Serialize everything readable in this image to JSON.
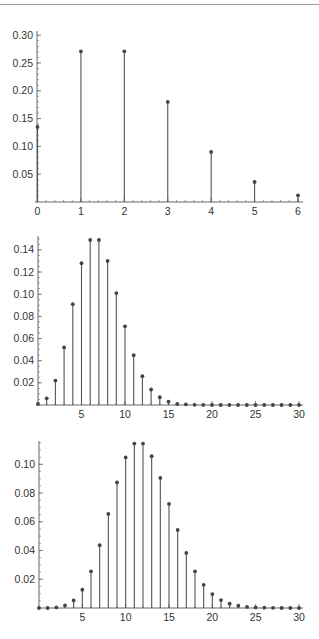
{
  "chart_data": [
    {
      "type": "stem",
      "title": "",
      "xlabel": "",
      "ylabel": "",
      "description": "Poisson probability mass function, lambda = 2",
      "x": [
        0,
        1,
        2,
        3,
        4,
        5,
        6
      ],
      "values": [
        0.135,
        0.271,
        0.271,
        0.18,
        0.09,
        0.036,
        0.012
      ],
      "xlim": [
        0,
        6
      ],
      "ylim": [
        0,
        0.31
      ],
      "xticks": [
        "0",
        "1",
        "2",
        "3",
        "4",
        "5",
        "6"
      ],
      "yticks": [
        "0.05",
        "0.10",
        "0.15",
        "0.20",
        "0.25",
        "0.30"
      ],
      "grid": false,
      "legend": null
    },
    {
      "type": "stem",
      "title": "",
      "xlabel": "",
      "ylabel": "",
      "description": "Poisson probability mass function, lambda = 7",
      "x": [
        0,
        1,
        2,
        3,
        4,
        5,
        6,
        7,
        8,
        9,
        10,
        11,
        12,
        13,
        14,
        15,
        16,
        17,
        18,
        19,
        20,
        21,
        22,
        23,
        24,
        25,
        26,
        27,
        28,
        29,
        30
      ],
      "values": [
        0.001,
        0.006,
        0.022,
        0.052,
        0.091,
        0.128,
        0.149,
        0.149,
        0.13,
        0.101,
        0.071,
        0.045,
        0.026,
        0.014,
        0.007,
        0.003,
        0.001,
        0.0006,
        0.0002,
        0.0001,
        0,
        0,
        0,
        0,
        0,
        0,
        0,
        0,
        0,
        0,
        0
      ],
      "xlim": [
        0,
        30
      ],
      "ylim": [
        0,
        0.152
      ],
      "xticks": [
        "5",
        "10",
        "15",
        "20",
        "25",
        "30"
      ],
      "yticks": [
        "0.02",
        "0.04",
        "0.06",
        "0.08",
        "0.10",
        "0.12",
        "0.14"
      ],
      "grid": false,
      "legend": null
    },
    {
      "type": "stem",
      "title": "",
      "xlabel": "",
      "ylabel": "",
      "description": "Poisson probability mass function, lambda = 12",
      "x": [
        0,
        1,
        2,
        3,
        4,
        5,
        6,
        7,
        8,
        9,
        10,
        11,
        12,
        13,
        14,
        15,
        16,
        17,
        18,
        19,
        20,
        21,
        22,
        23,
        24,
        25,
        26,
        27,
        28,
        29,
        30
      ],
      "values": [
        0,
        0,
        0.0004,
        0.0018,
        0.0053,
        0.0127,
        0.0255,
        0.0437,
        0.0655,
        0.0874,
        0.1048,
        0.1144,
        0.1144,
        0.1056,
        0.0905,
        0.0724,
        0.0543,
        0.0383,
        0.0255,
        0.0161,
        0.0097,
        0.0055,
        0.003,
        0.0016,
        0.0008,
        0.0004,
        0.0002,
        0.0001,
        0,
        0,
        0
      ],
      "xlim": [
        0,
        30
      ],
      "ylim": [
        0,
        0.12
      ],
      "xticks": [
        "5",
        "10",
        "15",
        "20",
        "25",
        "30"
      ],
      "yticks": [
        "0.02",
        "0.04",
        "0.06",
        "0.08",
        "0.10"
      ],
      "grid": false,
      "legend": null
    }
  ],
  "layout": [
    {
      "x0": 37.5,
      "x1": 298,
      "xmin": 0,
      "xmax": 6,
      "base": 202,
      "top": 31,
      "yscale": 556,
      "axisEnd": 303,
      "yAxisTop": 31,
      "minorPerMajor": 5,
      "yMinor": 0.01,
      "xMinor": 0.2
    },
    {
      "x0": 38,
      "x1": 299,
      "xmin": 0,
      "xmax": 30,
      "base": 405,
      "top": 236,
      "yscale": 1108,
      "axisEnd": 303,
      "yAxisTop": 236,
      "minorPerMajor": 4,
      "yMinor": 0.005,
      "xMinor": 1
    },
    {
      "x0": 39,
      "x1": 299,
      "xmin": 0,
      "xmax": 30,
      "base": 608,
      "top": 441,
      "yscale": 1437,
      "axisEnd": 303,
      "yAxisTop": 441,
      "minorPerMajor": 4,
      "yMinor": 0.005,
      "xMinor": 1
    }
  ],
  "style": {
    "stem_color": "#555555",
    "axis_color": "#666666",
    "marker_color": "#444444"
  }
}
